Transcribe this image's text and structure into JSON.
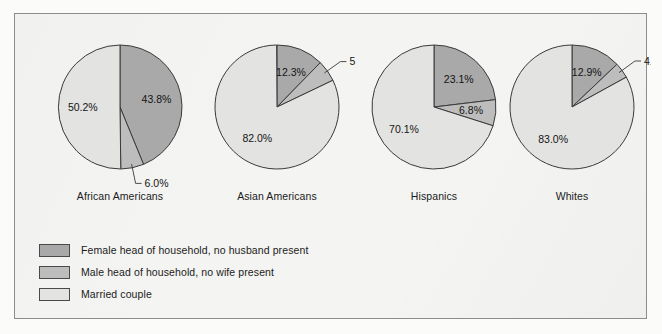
{
  "figure": {
    "background_color": "#f4f4f2",
    "border_color": "#8d8d8d"
  },
  "legend": {
    "items": [
      {
        "label": "Female head of household, no husband present",
        "color": "#a9a9a9"
      },
      {
        "label": "Male head of household, no wife present",
        "color": "#bdbdbd"
      },
      {
        "label": "Married couple",
        "color": "#e3e3e1"
      }
    ]
  },
  "chart_data": {
    "type": "pie",
    "title": "",
    "subtitle": "",
    "xlabel": "",
    "ylabel": "",
    "legend_position": "bottom-left",
    "grid": false,
    "categories": [
      "Female head of household, no husband present",
      "Male head of household, no wife present",
      "Married couple"
    ],
    "colors": [
      "#a9a9a9",
      "#bdbdbd",
      "#e3e3e1"
    ],
    "charts": [
      {
        "name": "African Americans",
        "labels": [
          "Female head of household, no husband present",
          "Male head of household, no wife present",
          "Married couple"
        ],
        "values": [
          43.8,
          6.0,
          50.2
        ],
        "value_labels": [
          "43.8%",
          "6.0%",
          "50.2%"
        ],
        "label_placement": [
          "inside",
          "outside",
          "inside"
        ]
      },
      {
        "name": "Asian Americans",
        "labels": [
          "Female head of household, no husband present",
          "Male head of household, no wife present",
          "Married couple"
        ],
        "values": [
          12.3,
          5.6,
          82.0
        ],
        "value_labels": [
          "12.3%",
          "5.6%",
          "82.0%"
        ],
        "label_placement": [
          "inside",
          "outside",
          "inside"
        ]
      },
      {
        "name": "Hispanics",
        "labels": [
          "Female head of household, no husband present",
          "Male head of household, no wife present",
          "Married couple"
        ],
        "values": [
          23.1,
          6.8,
          70.1
        ],
        "value_labels": [
          "23.1%",
          "6.8%",
          "70.1%"
        ],
        "label_placement": [
          "inside",
          "inside",
          "inside"
        ]
      },
      {
        "name": "Whites",
        "labels": [
          "Female head of household, no husband present",
          "Male head of household, no wife present",
          "Married couple"
        ],
        "values": [
          12.9,
          4.1,
          83.0
        ],
        "value_labels": [
          "12.9%",
          "4.1%",
          "83.0%"
        ],
        "label_placement": [
          "inside",
          "outside",
          "inside"
        ]
      }
    ]
  }
}
